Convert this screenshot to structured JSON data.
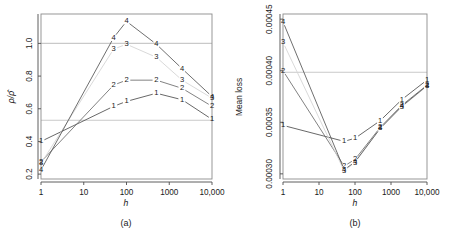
{
  "figure": {
    "name": "two-panel-line-chart",
    "width": 458,
    "height": 232,
    "background": "#ffffff"
  },
  "chart_data": [
    {
      "type": "line",
      "panel": "a",
      "panel_label": "(a)",
      "title": "",
      "xlabel": "h",
      "ylabel": "ρ/ρ̂",
      "xscale": "log",
      "yscale": "linear",
      "xlim": [
        1,
        10000
      ],
      "ylim": [
        0.17,
        1.18
      ],
      "xticks": [
        1,
        10,
        100,
        1000,
        10000
      ],
      "xticklabels": [
        "1",
        "10",
        "100",
        "1000",
        "10,000"
      ],
      "yticks": [
        0.2,
        0.4,
        0.6,
        0.8,
        1.0
      ],
      "yticklabels": [
        "0.2",
        "0.4",
        "0.6",
        "0.8",
        "1.0"
      ],
      "grid": false,
      "legend": "none",
      "reference_lines": [
        {
          "y": 1.0,
          "color": "#cccccc"
        },
        {
          "y": 0.53,
          "color": "#cccccc"
        }
      ],
      "x": [
        1,
        50,
        100,
        500,
        2000,
        10000
      ],
      "series": [
        {
          "name": "1",
          "marker": "1",
          "color": "#4d4d4d",
          "values": [
            0.4,
            0.615,
            0.645,
            0.695,
            0.655,
            0.535
          ]
        },
        {
          "name": "2",
          "marker": "2",
          "color": "#6b6b6b",
          "values": [
            0.275,
            0.745,
            0.775,
            0.775,
            0.725,
            0.615
          ]
        },
        {
          "name": "3",
          "marker": "3",
          "color": "#d2d2d2",
          "values": [
            0.265,
            0.965,
            0.995,
            0.915,
            0.775,
            0.665
          ]
        },
        {
          "name": "4",
          "marker": "4",
          "color": "#555555",
          "values": [
            0.225,
            1.035,
            1.135,
            0.995,
            0.845,
            0.675
          ]
        }
      ]
    },
    {
      "type": "line",
      "panel": "b",
      "panel_label": "(b)",
      "title": "",
      "xlabel": "h",
      "ylabel": "Mean loss",
      "xscale": "log",
      "yscale": "linear",
      "xlim": [
        1,
        10000
      ],
      "ylim": [
        0.000295,
        0.0
      ],
      "ylim_actual": [
        0.000295,
        0.000455
      ],
      "xticks": [
        1,
        10,
        100,
        1000,
        10000
      ],
      "xticklabels": [
        "1",
        "10",
        "100",
        "1000",
        "10,000"
      ],
      "yticks": [
        0.0003,
        0.00035,
        0.0004,
        0.00045
      ],
      "yticklabels": [
        "0.00030",
        "0.00035",
        "0.00040",
        "0.00045"
      ],
      "grid": false,
      "legend": "none",
      "reference_lines": [
        {
          "y": 0.0003985,
          "color": "#cccccc"
        }
      ],
      "x": [
        1,
        50,
        100,
        500,
        2000,
        10000
      ],
      "series": [
        {
          "name": "1",
          "marker": "1",
          "color": "#4d4d4d",
          "values": [
            0.000347,
            0.0003315,
            0.0003345,
            0.0003515,
            0.000372,
            0.000391
          ]
        },
        {
          "name": "2",
          "marker": "2",
          "color": "#6b6b6b",
          "values": [
            0.0004,
            0.0003075,
            0.000314,
            0.000345,
            0.0003665,
            0.000386
          ]
        },
        {
          "name": "3",
          "marker": "3",
          "color": "#d2d2d2",
          "values": [
            0.0004275,
            0.000303,
            0.000311,
            0.000344,
            0.000365,
            0.000385
          ]
        },
        {
          "name": "4",
          "marker": "4",
          "color": "#555555",
          "values": [
            0.0004475,
            0.000304,
            0.0003115,
            0.000344,
            0.0003655,
            0.0003855
          ]
        }
      ]
    }
  ]
}
